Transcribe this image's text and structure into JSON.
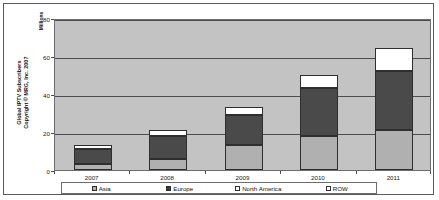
{
  "chart_data": {
    "type": "bar",
    "subtype": "stacked-column",
    "title": "",
    "xlabel": "",
    "ylabel": "Global IPTV Subscribers\nCopyright © MRG, Inc. 2007",
    "unit_label": "Millions",
    "categories": [
      "2007",
      "2008",
      "2009",
      "2010",
      "2011"
    ],
    "series": [
      {
        "name": "Asia",
        "values": [
          3,
          6,
          13,
          18,
          21
        ],
        "color": "#b0b0b0"
      },
      {
        "name": "Europe",
        "values": [
          8,
          12,
          16,
          25,
          31
        ],
        "color": "#4a4a4a"
      },
      {
        "name": "North America",
        "values": [
          2,
          3,
          4,
          7,
          12
        ],
        "color": "#ffffff"
      },
      {
        "name": "ROW",
        "values": [
          0,
          0,
          0,
          0,
          0
        ],
        "color": "#fdfdfd"
      }
    ],
    "totals": [
      13,
      21,
      33,
      50,
      64
    ],
    "ylim": [
      0,
      80
    ],
    "yticks": [
      0,
      20,
      40,
      60,
      80
    ],
    "ytick_labels": [
      "0",
      "20",
      "40",
      "60",
      "80"
    ],
    "grid": true,
    "legend_position": "bottom",
    "plot_background": "#c3c3c3"
  },
  "legend": {
    "entries": [
      {
        "label": "Asia"
      },
      {
        "label": "Europe"
      },
      {
        "label": "North America"
      },
      {
        "label": "ROW"
      }
    ]
  }
}
